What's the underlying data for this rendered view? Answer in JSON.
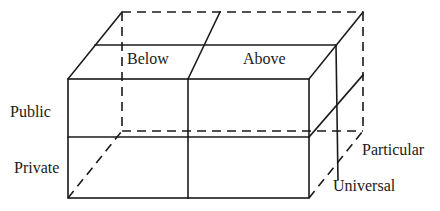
{
  "diagram": {
    "type": "3d-cube-classification",
    "labels": {
      "top_left": "Below",
      "top_right": "Above",
      "row_upper": "Public",
      "row_lower": "Private",
      "depth_back": "Particular",
      "depth_front": "Universal"
    },
    "colors": {
      "line": "#1a1a1a",
      "background": "#ffffff"
    },
    "dimensions": {
      "axis_horizontal": [
        "Below",
        "Above"
      ],
      "axis_vertical": [
        "Public",
        "Private"
      ],
      "axis_depth": [
        "Particular",
        "Universal"
      ]
    }
  }
}
